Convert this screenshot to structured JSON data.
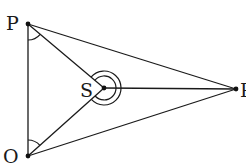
{
  "diagram": {
    "type": "geometry-figure",
    "points": {
      "P": {
        "label": "P",
        "x": 28,
        "y": 24
      },
      "O": {
        "label": "O",
        "x": 28,
        "y": 156
      },
      "S": {
        "label": "S",
        "x": 104,
        "y": 88
      },
      "R": {
        "label": "R",
        "x": 236,
        "y": 89
      }
    },
    "segments": [
      {
        "from": "P",
        "to": "R"
      },
      {
        "from": "O",
        "to": "R"
      },
      {
        "from": "P",
        "to": "O"
      },
      {
        "from": "P",
        "to": "S"
      },
      {
        "from": "O",
        "to": "S"
      },
      {
        "from": "S",
        "to": "R"
      }
    ],
    "angle_marks": [
      {
        "vertex": "P",
        "between": [
          "O",
          "S"
        ],
        "arcs": 1
      },
      {
        "vertex": "O",
        "between": [
          "P",
          "S"
        ],
        "arcs": 1
      },
      {
        "vertex": "S",
        "type": "reflex",
        "arcs": 2
      }
    ],
    "colors": {
      "stroke": "#1a1a1a",
      "background": "#ffffff"
    }
  }
}
